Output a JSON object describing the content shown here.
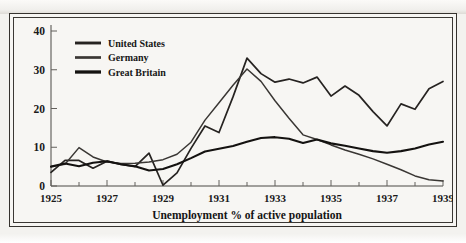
{
  "figure": {
    "background_color": "#f7f6f3",
    "frame_color": "#35322e"
  },
  "chart_data": {
    "type": "line",
    "title": "",
    "subtitle": "",
    "xlabel": "Unemployment % of active population",
    "ylabel": "",
    "xlim": [
      1925,
      1939
    ],
    "ylim": [
      0,
      40
    ],
    "grid": false,
    "legend_position": "top-left",
    "x_tick_labels": [
      "1925",
      "1927",
      "1929",
      "1931",
      "1933",
      "1935",
      "1937",
      "1939"
    ],
    "x_tick_values": [
      1925,
      1927,
      1929,
      1931,
      1933,
      1935,
      1937,
      1939
    ],
    "x_minor_ticks": [
      1926,
      1928,
      1930,
      1932,
      1934,
      1936,
      1938
    ],
    "y_tick_labels": [
      "0",
      "10",
      "20",
      "30",
      "40"
    ],
    "y_tick_values": [
      0,
      10,
      20,
      30,
      40
    ],
    "x": [
      1925,
      1925.5,
      1926,
      1926.5,
      1927,
      1927.5,
      1928,
      1928.5,
      1929,
      1929.5,
      1930,
      1930.5,
      1931,
      1931.5,
      1932,
      1932.5,
      1933,
      1933.5,
      1934,
      1934.5,
      1935,
      1935.5,
      1936,
      1936.5,
      1937,
      1937.5,
      1938,
      1938.5,
      1939
    ],
    "series": [
      {
        "name": "United States",
        "color": "#262321",
        "line_width": 1.7,
        "values": [
          3.5,
          6.6,
          6.6,
          4.6,
          6.4,
          5.6,
          5.0,
          8.5,
          0.2,
          3.4,
          9.7,
          15.5,
          13.8,
          23.0,
          33.0,
          29.0,
          26.8,
          27.6,
          26.6,
          28.1,
          23.2,
          25.8,
          23.4,
          19.2,
          15.5,
          21.2,
          19.8,
          25.1,
          27.0
        ]
      },
      {
        "name": "Germany",
        "color": "#3a3734",
        "line_width": 1.5,
        "values": [
          5.0,
          5.6,
          9.9,
          7.5,
          6.2,
          5.8,
          5.9,
          6.2,
          6.8,
          8.2,
          11.3,
          17.0,
          21.5,
          26.0,
          30.2,
          27.0,
          22.0,
          17.5,
          13.2,
          12.0,
          10.6,
          9.3,
          8.2,
          7.0,
          5.6,
          4.2,
          2.6,
          1.6,
          1.3
        ]
      },
      {
        "name": "Great Britain",
        "color": "#141210",
        "line_width": 2.1,
        "values": [
          5.0,
          5.8,
          5.1,
          6.0,
          6.4,
          5.6,
          5.1,
          4.0,
          4.4,
          5.6,
          7.2,
          8.9,
          9.6,
          10.3,
          11.4,
          12.4,
          12.6,
          12.2,
          11.1,
          12.0,
          11.0,
          10.4,
          9.7,
          9.0,
          8.6,
          9.0,
          9.7,
          10.7,
          11.4
        ]
      }
    ]
  },
  "legend": {
    "items": [
      {
        "label": "United States"
      },
      {
        "label": "Germany"
      },
      {
        "label": "Great Britain"
      }
    ]
  }
}
